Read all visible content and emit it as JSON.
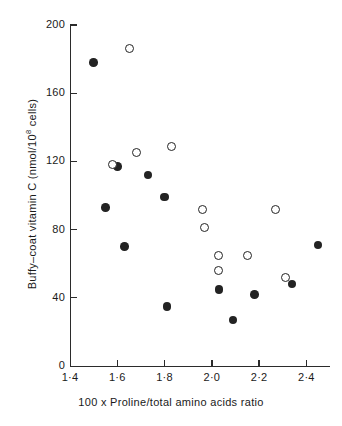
{
  "chart_data": {
    "type": "scatter",
    "title": "",
    "xlabel": "100 x Proline/total amino acids ratio",
    "ylabel_prefix": "Buffy–coat vitamin C (nmol/10",
    "ylabel_exponent": "8",
    "ylabel_suffix": " cells)",
    "xlim": [
      1.4,
      2.5
    ],
    "ylim": [
      0,
      200
    ],
    "xticks": [
      1.4,
      1.6,
      1.8,
      2.0,
      2.2,
      2.4
    ],
    "xtick_labels": [
      "1·4",
      "1·6",
      "1·8",
      "2·0",
      "2·2",
      "2·4"
    ],
    "yticks": [
      0,
      40,
      80,
      120,
      160,
      200
    ],
    "ytick_labels": [
      "0",
      "40",
      "80",
      "120",
      "160",
      "200"
    ],
    "grid": false,
    "legend": "none",
    "marker_color": "#232323",
    "series": [
      {
        "name": "filled-circles",
        "marker": "filled-circle",
        "points": [
          {
            "x": 1.5,
            "y": 178
          },
          {
            "x": 1.6,
            "y": 117
          },
          {
            "x": 1.55,
            "y": 93
          },
          {
            "x": 1.63,
            "y": 70
          },
          {
            "x": 1.73,
            "y": 112
          },
          {
            "x": 1.8,
            "y": 99
          },
          {
            "x": 1.81,
            "y": 35
          },
          {
            "x": 2.03,
            "y": 45
          },
          {
            "x": 2.09,
            "y": 27
          },
          {
            "x": 2.18,
            "y": 42
          },
          {
            "x": 2.34,
            "y": 48
          },
          {
            "x": 2.45,
            "y": 71
          }
        ]
      },
      {
        "name": "open-circles",
        "marker": "open-circle",
        "points": [
          {
            "x": 1.65,
            "y": 186
          },
          {
            "x": 1.58,
            "y": 118
          },
          {
            "x": 1.68,
            "y": 125
          },
          {
            "x": 1.83,
            "y": 129
          },
          {
            "x": 1.96,
            "y": 92
          },
          {
            "x": 1.97,
            "y": 81
          },
          {
            "x": 2.03,
            "y": 65
          },
          {
            "x": 2.03,
            "y": 56
          },
          {
            "x": 2.15,
            "y": 65
          },
          {
            "x": 2.27,
            "y": 92
          },
          {
            "x": 2.31,
            "y": 52
          }
        ]
      }
    ]
  },
  "axes": {
    "plot_left_px": 70,
    "plot_right_px": 330,
    "plot_top_px": 25,
    "plot_bottom_px": 366
  }
}
